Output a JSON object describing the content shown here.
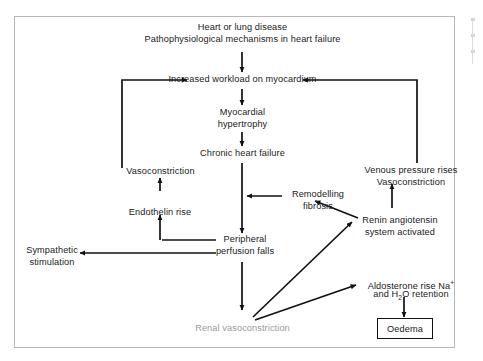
{
  "diagram": {
    "title_lines": [
      "Heart or lung disease",
      "Pathophysiological mechanisms in heart failure"
    ],
    "nodes": {
      "source_line1": "Heart or lung disease",
      "source_line2": "Pathophysiological mechanisms in heart failure",
      "increased_workload": "Increased workload on myocardium",
      "myocardial_hypertrophy_line1": "Myocardial",
      "myocardial_hypertrophy_line2": "hypertrophy",
      "chronic_heart_failure": "Chronic heart failure",
      "vasoconstriction_left": "Vasoconstriction",
      "endothelin_rise": "Endothelin rise",
      "sympathetic_line1": "Sympathetic",
      "sympathetic_line2": "stimulation",
      "peripheral_line1": "Peripheral",
      "peripheral_line2": "perfusion falls",
      "remodelling_line1": "Remodelling",
      "remodelling_line2": "fibrosis",
      "venous_line1": "Venous pressure rises",
      "venous_line2": "Vasoconstriction",
      "renin_line1": "Renin angiotensin",
      "renin_line2": "system activated",
      "aldosterone_line1_pre": "Aldosterone rise Na",
      "aldosterone_line1_sup": "+",
      "aldosterone_line2_pre": "and H",
      "aldosterone_line2_sub": "2",
      "aldosterone_line2_post": "O retention",
      "renal_vasoconstriction": "Renal vasoconstriction",
      "oedema": "Oedema"
    },
    "colors": {
      "text": "#1a1a1a",
      "faded_text": "#9a9a9a",
      "arrow": "#111111",
      "frame_border": "#b8b8b8",
      "box_border": "#111111",
      "background": "#ffffff"
    }
  }
}
